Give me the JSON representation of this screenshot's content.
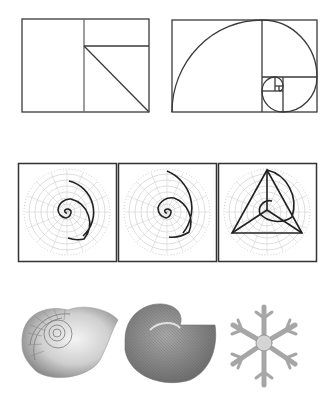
{
  "figure": {
    "width": 334,
    "height": 407,
    "background": "#ffffff",
    "line_color": "#3a3a3a",
    "grid_color": "#b8b8b8",
    "rows": [
      {
        "name": "golden-rectangles",
        "panels": [
          {
            "name": "golden-rectangle-construction",
            "description": "Rectangle split into square plus rectangle with diagonal"
          },
          {
            "name": "golden-spiral-rectangle",
            "description": "Nested golden rectangles with Fibonacci spiral arcs"
          }
        ]
      },
      {
        "name": "polar-spirals",
        "panels": [
          {
            "name": "logarithmic-spiral-small",
            "description": "Polar grid with tight logarithmic spiral"
          },
          {
            "name": "logarithmic-spiral-large",
            "description": "Polar grid with wider logarithmic spiral"
          },
          {
            "name": "spiral-with-triangle",
            "description": "Polar grid with spiral and inscribed equilateral triangle"
          }
        ]
      },
      {
        "name": "natural-examples",
        "panels": [
          {
            "name": "nautilus-shell-cross-section",
            "description": "Nautilus shell showing chambered spiral"
          },
          {
            "name": "ammonite-shell",
            "description": "Ribbed spiral shell"
          },
          {
            "name": "snowflake",
            "description": "Six-armed dendritic snowflake crystal"
          }
        ]
      }
    ]
  }
}
